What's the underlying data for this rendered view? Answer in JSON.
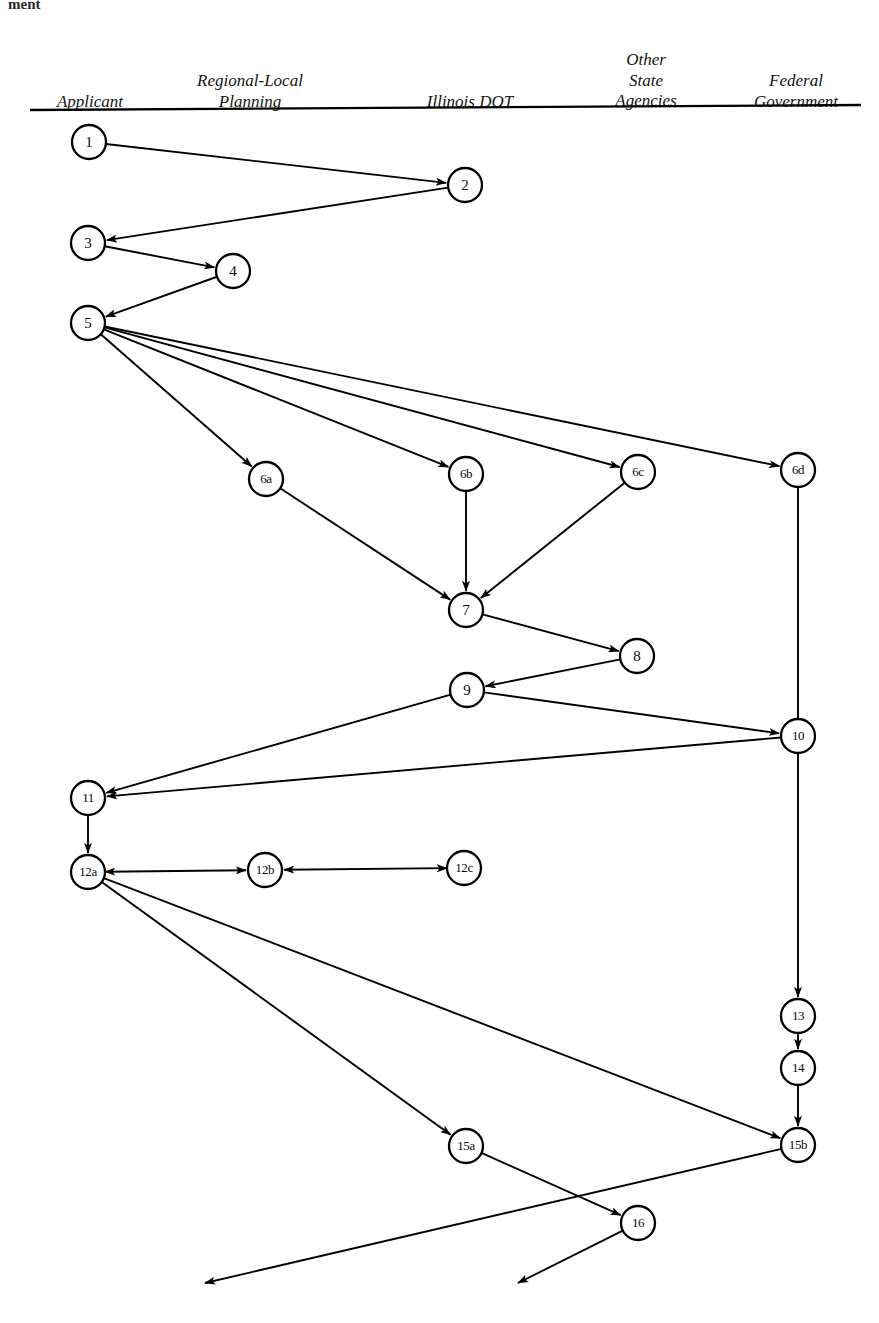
{
  "page": {
    "corner_fragment": "ment",
    "background": "#ffffff",
    "ink": "#000000",
    "width": 879,
    "height": 1323
  },
  "columns": {
    "rule": {
      "x1": 30,
      "y1": 110,
      "x2": 861,
      "y2": 105
    },
    "headers": [
      {
        "id": "applicant",
        "label": "Applicant",
        "cx": 90,
        "baseline_y": 96
      },
      {
        "id": "regional-local",
        "label": "Regional-Local\nPlanning",
        "cx": 250,
        "baseline_y": 96
      },
      {
        "id": "illinois-dot",
        "label": "Illinois DOT",
        "cx": 470,
        "baseline_y": 96
      },
      {
        "id": "other-state",
        "label": "Other\nState\nAgencies",
        "cx": 646,
        "baseline_y": 96
      },
      {
        "id": "federal",
        "label": "Federal\nGovernment",
        "cx": 796,
        "baseline_y": 96
      }
    ]
  },
  "chart_data": {
    "type": "diagram",
    "diagram_kind": "swimlane-flowchart",
    "node_radius": 17,
    "nodes": [
      {
        "id": "1",
        "label": "1",
        "cx": 89,
        "cy": 142,
        "column": "applicant"
      },
      {
        "id": "2",
        "label": "2",
        "cx": 465,
        "cy": 185,
        "column": "illinois-dot"
      },
      {
        "id": "3",
        "label": "3",
        "cx": 88,
        "cy": 243,
        "column": "applicant"
      },
      {
        "id": "4",
        "label": "4",
        "cx": 233,
        "cy": 271,
        "column": "regional-local"
      },
      {
        "id": "5",
        "label": "5",
        "cx": 88,
        "cy": 323,
        "column": "applicant"
      },
      {
        "id": "6a",
        "label": "6a",
        "cx": 266,
        "cy": 479,
        "column": "regional-local"
      },
      {
        "id": "6b",
        "label": "6b",
        "cx": 466,
        "cy": 474,
        "column": "illinois-dot"
      },
      {
        "id": "6c",
        "label": "6c",
        "cx": 638,
        "cy": 472,
        "column": "other-state"
      },
      {
        "id": "6d",
        "label": "6d",
        "cx": 798,
        "cy": 470,
        "column": "federal"
      },
      {
        "id": "7",
        "label": "7",
        "cx": 466,
        "cy": 610,
        "column": "illinois-dot"
      },
      {
        "id": "8",
        "label": "8",
        "cx": 637,
        "cy": 656,
        "column": "other-state"
      },
      {
        "id": "9",
        "label": "9",
        "cx": 467,
        "cy": 690,
        "column": "illinois-dot"
      },
      {
        "id": "10",
        "label": "10",
        "cx": 798,
        "cy": 736,
        "column": "federal"
      },
      {
        "id": "11",
        "label": "11",
        "cx": 88,
        "cy": 798,
        "column": "applicant"
      },
      {
        "id": "12a",
        "label": "12a",
        "cx": 88,
        "cy": 872,
        "column": "applicant"
      },
      {
        "id": "12b",
        "label": "12b",
        "cx": 265,
        "cy": 870,
        "column": "regional-local"
      },
      {
        "id": "12c",
        "label": "12c",
        "cx": 464,
        "cy": 868,
        "column": "illinois-dot"
      },
      {
        "id": "13",
        "label": "13",
        "cx": 798,
        "cy": 1016,
        "column": "federal"
      },
      {
        "id": "14",
        "label": "14",
        "cx": 798,
        "cy": 1068,
        "column": "federal"
      },
      {
        "id": "15a",
        "label": "15a",
        "cx": 466,
        "cy": 1146,
        "column": "illinois-dot"
      },
      {
        "id": "15b",
        "label": "15b",
        "cx": 798,
        "cy": 1145,
        "column": "federal"
      },
      {
        "id": "16",
        "label": "16",
        "cx": 638,
        "cy": 1223,
        "column": "other-state"
      }
    ],
    "edges": [
      {
        "from": "1",
        "to": "2",
        "arrow": "forward"
      },
      {
        "from": "2",
        "to": "3",
        "arrow": "forward"
      },
      {
        "from": "3",
        "to": "4",
        "arrow": "forward"
      },
      {
        "from": "4",
        "to": "5",
        "arrow": "forward"
      },
      {
        "from": "5",
        "to": "6a",
        "arrow": "forward"
      },
      {
        "from": "5",
        "to": "6b",
        "arrow": "forward"
      },
      {
        "from": "5",
        "to": "6c",
        "arrow": "forward"
      },
      {
        "from": "5",
        "to": "6d",
        "arrow": "forward"
      },
      {
        "from": "6a",
        "to": "7",
        "arrow": "forward"
      },
      {
        "from": "6b",
        "to": "7",
        "arrow": "forward"
      },
      {
        "from": "6c",
        "to": "7",
        "arrow": "forward"
      },
      {
        "from": "7",
        "to": "8",
        "arrow": "forward"
      },
      {
        "from": "8",
        "to": "9",
        "arrow": "forward"
      },
      {
        "from": "9",
        "to": "10",
        "arrow": "forward"
      },
      {
        "from": "9",
        "to": "11",
        "arrow": "forward"
      },
      {
        "from": "6d",
        "to": "10",
        "arrow": "none"
      },
      {
        "from": "10",
        "to": "11",
        "arrow": "forward"
      },
      {
        "from": "11",
        "to": "12a",
        "arrow": "forward"
      },
      {
        "from": "12a",
        "to": "12b",
        "arrow": "both"
      },
      {
        "from": "12c",
        "to": "12b",
        "arrow": "both"
      },
      {
        "from": "10",
        "to": "13",
        "arrow": "forward"
      },
      {
        "from": "13",
        "to": "14",
        "arrow": "forward"
      },
      {
        "from": "14",
        "to": "15b",
        "arrow": "forward"
      },
      {
        "from": "12a",
        "to": "15a",
        "arrow": "forward"
      },
      {
        "from": "12a",
        "to": "15b",
        "arrow": "forward"
      },
      {
        "from": "15a",
        "to": "16",
        "arrow": "forward"
      }
    ],
    "exit_edges": [
      {
        "id": "exit-from-15b",
        "from": "15b",
        "to_x": 205,
        "to_y": 1283,
        "arrow": "forward"
      },
      {
        "id": "exit-from-16",
        "from": "16",
        "to_x": 518,
        "to_y": 1283,
        "arrow": "forward"
      }
    ]
  }
}
